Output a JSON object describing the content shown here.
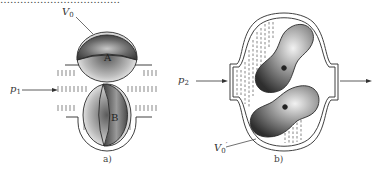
{
  "figure": {
    "top_cutoff_text": "………………………………",
    "panels": [
      {
        "caption": "a)",
        "labels": {
          "volume": {
            "base": "V",
            "sub": "0",
            "prime": ""
          },
          "pressure": {
            "base": "p",
            "sub": "1"
          },
          "rotor_top": "A",
          "rotor_bottom": "B"
        }
      },
      {
        "caption": "b)",
        "labels": {
          "volume": {
            "base": "V",
            "sub": "0",
            "prime": "′"
          },
          "pressure": {
            "base": "p",
            "sub": "2"
          }
        }
      }
    ],
    "colors": {
      "line": "#2a2a2a",
      "rotor_dark": "#3a3a3a",
      "rotor_light": "#e6e6e6",
      "hatch": "#555555",
      "background": "#ffffff"
    }
  }
}
